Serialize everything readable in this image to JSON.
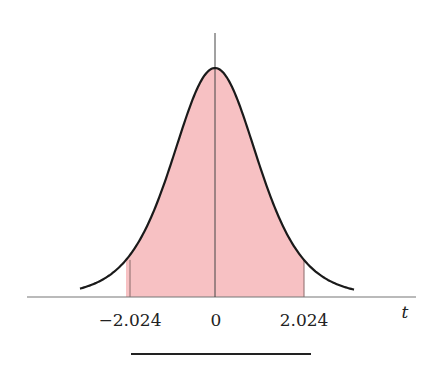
{
  "chart_data": {
    "type": "area",
    "title": "",
    "xlabel": "t",
    "ylabel": "",
    "tick_labels": [
      "−2.024",
      "0",
      "2.024"
    ],
    "ticks": [
      -2.024,
      0,
      2.024
    ],
    "shaded_region": {
      "from": -2.024,
      "to": 2.024,
      "color": "#f7c1c3"
    },
    "curve_color": "#1a1a1a",
    "grid": false,
    "legend": null,
    "answer_blank": true
  },
  "labels": {
    "neg_tick": "−2.024",
    "zero_tick": "0",
    "pos_tick": "2.024",
    "axis_var": "t"
  }
}
